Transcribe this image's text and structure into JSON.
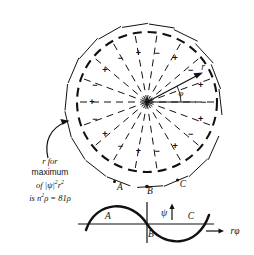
{
  "figure": {
    "circle": {
      "cx": 147,
      "cy": 102,
      "r": 70,
      "dashed": true
    },
    "spokes": 18,
    "vector": {
      "label": "r",
      "angle_label": "φ",
      "angle_deg": 28
    },
    "signs": [
      {
        "text": "−",
        "angle_deg": 80
      },
      {
        "text": "+",
        "angle_deg": 100
      },
      {
        "text": "−",
        "angle_deg": 120
      },
      {
        "text": "+",
        "angle_deg": 140
      },
      {
        "text": "−",
        "angle_deg": 160
      },
      {
        "text": "+",
        "angle_deg": 180
      },
      {
        "text": "−",
        "angle_deg": 200
      },
      {
        "text": "+",
        "angle_deg": 220
      },
      {
        "text": "−",
        "angle_deg": 240
      },
      {
        "text": "+",
        "angle_deg": 260
      },
      {
        "text": "−",
        "angle_deg": 280
      },
      {
        "text": "+",
        "angle_deg": 300
      },
      {
        "text": "−",
        "angle_deg": 320
      },
      {
        "text": "+",
        "angle_deg": 340
      },
      {
        "text": "−",
        "angle_deg": 0
      },
      {
        "text": "+",
        "angle_deg": 20
      },
      {
        "text": "−",
        "angle_deg": 40
      },
      {
        "text": "+",
        "angle_deg": 60
      }
    ],
    "arc_points": [
      {
        "label": "A",
        "x": 120,
        "y": 186
      },
      {
        "label": "B",
        "x": 150,
        "y": 190
      },
      {
        "label": "C",
        "x": 183,
        "y": 184
      }
    ],
    "annotation": {
      "line1": "r for",
      "line2": "maximum",
      "line3_prefix": "of |ψ|",
      "line3_sup1": "2",
      "line3_mid": "r",
      "line3_sup2": "2",
      "line4_prefix": "is n",
      "line4_sup": "2",
      "line4_rest": "ρ = 81ρ"
    },
    "wave": {
      "psi_label": "ψ",
      "axis_label": "rφ",
      "axis_arrow": "→",
      "points": [
        {
          "label": "A",
          "x": 108,
          "y": 216
        },
        {
          "label": "B",
          "x": 151,
          "y": 234
        },
        {
          "label": "C",
          "x": 191,
          "y": 216
        }
      ]
    }
  }
}
